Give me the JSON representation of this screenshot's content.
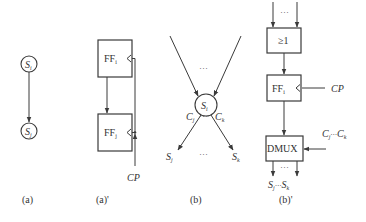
{
  "figure": {
    "panels": {
      "a": {
        "caption": "(a)",
        "nodes": [
          {
            "base": "S",
            "sub": "i"
          },
          {
            "base": "S",
            "sub": "j"
          }
        ]
      },
      "a_prime": {
        "caption": "(a)'",
        "blocks": [
          {
            "base": "FF",
            "sub": "i"
          },
          {
            "base": "FF",
            "sub": "j"
          }
        ],
        "clock_label": "CP"
      },
      "b": {
        "caption": "(b)",
        "center_node": {
          "base": "S",
          "sub": "i"
        },
        "conditions": [
          {
            "base": "C",
            "sub": "j"
          },
          {
            "base": "C",
            "sub": "k"
          }
        ],
        "targets": [
          {
            "base": "S",
            "sub": "j"
          },
          {
            "base": "S",
            "sub": "k"
          }
        ],
        "ellipsis": "···"
      },
      "b_prime": {
        "caption": "(b)'",
        "or_gate_label": "≥1",
        "ff_block": {
          "base": "FF",
          "sub": "i"
        },
        "dmux_label": "DMUX",
        "clock_label": "CP",
        "select_label": {
          "c1": "C",
          "c1_sub": "j",
          "mid": "···",
          "c2": "C",
          "c2_sub": "k"
        },
        "outputs_label": {
          "s1": "S",
          "s1_sub": "j",
          "mid": "···",
          "s2": "S",
          "s2_sub": "k"
        },
        "ellipsis": "···"
      }
    }
  }
}
